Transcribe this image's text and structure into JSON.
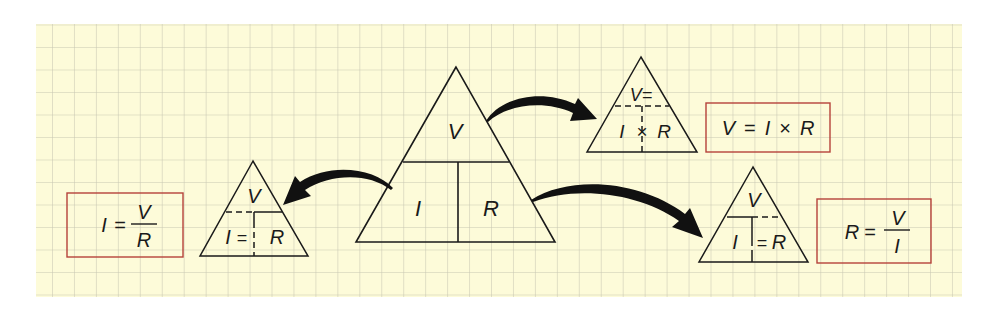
{
  "diagram": {
    "colors": {
      "paper": "#fdfbd9",
      "grid": "#c8c7b2",
      "ink": "#1a1a1a",
      "formula_box_border": "#b5423a"
    },
    "main_triangle": {
      "top": "V",
      "bottom_left": "I",
      "bottom_right": "R"
    },
    "triangle_voltage": {
      "top": "V=",
      "bottom_left": "I",
      "operator": "×",
      "bottom_right": "R"
    },
    "triangle_resistance": {
      "top": "V",
      "bottom_left": "I",
      "operator": "=",
      "bottom_right": "R"
    },
    "triangle_current": {
      "top": "V",
      "bottom_left": "I",
      "operator": "=",
      "bottom_right": "R"
    },
    "formula_voltage": {
      "lhs": "V",
      "eq": "=",
      "a": "I",
      "op": "×",
      "b": "R"
    },
    "formula_resistance": {
      "lhs": "R",
      "eq": "=",
      "num": "V",
      "den": "I"
    },
    "formula_current": {
      "lhs": "I",
      "eq": "=",
      "num": "V",
      "den": "R"
    }
  }
}
